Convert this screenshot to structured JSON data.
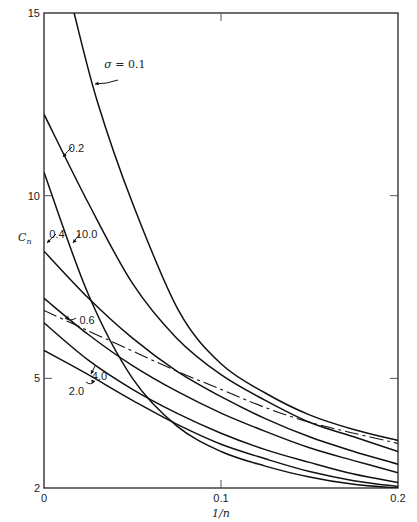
{
  "chart_data": {
    "type": "line",
    "title": "",
    "xlabel": "1/n",
    "ylabel": "C_n",
    "xlim": [
      0,
      0.2
    ],
    "ylim": [
      2,
      15
    ],
    "grid": false,
    "x_ticks": [
      {
        "value": 0,
        "label": "0"
      },
      {
        "value": 0.1,
        "label": "0.1"
      },
      {
        "value": 0.2,
        "label": "0.2"
      }
    ],
    "y_ticks": [
      {
        "value": 2,
        "label": "2"
      },
      {
        "value": 5,
        "label": "5"
      },
      {
        "value": 10,
        "label": "10"
      },
      {
        "value": 15,
        "label": "15"
      }
    ],
    "x": [
      0,
      0.025,
      0.05,
      0.075,
      0.1,
      0.125,
      0.15,
      0.175,
      0.2
    ],
    "series": [
      {
        "name": "σ = 0.1",
        "label": "σ = 0.1",
        "style": "solid",
        "points": [
          [
            0.017,
            15.0
          ],
          [
            0.03,
            12.6
          ],
          [
            0.05,
            9.8
          ],
          [
            0.076,
            6.86
          ],
          [
            0.1,
            5.4
          ],
          [
            0.125,
            4.6
          ],
          [
            0.15,
            4.0
          ],
          [
            0.175,
            3.6
          ],
          [
            0.2,
            3.3
          ]
        ]
      },
      {
        "name": "σ = 0.2",
        "label": "0.2",
        "style": "solid",
        "values": [
          12.23,
          9.8,
          7.6,
          6.1,
          5.1,
          4.4,
          3.8,
          3.4,
          3.0
        ]
      },
      {
        "name": "σ = 10.0",
        "label": "10.0",
        "style": "solid",
        "values": [
          10.64,
          7.3,
          5.0,
          3.7,
          3.0,
          2.6,
          2.3,
          2.1,
          2.0
        ]
      },
      {
        "name": "σ = 0.4",
        "label": "0.4",
        "style": "solid",
        "values": [
          8.48,
          7.2,
          6.1,
          5.2,
          4.5,
          3.9,
          3.4,
          3.0,
          2.65
        ]
      },
      {
        "name": "σ = 0.6",
        "label": "0.6",
        "style": "solid",
        "values": [
          7.19,
          6.2,
          5.35,
          4.65,
          4.05,
          3.55,
          3.1,
          2.75,
          2.42
        ]
      },
      {
        "name": "reference (dashed)",
        "label": "",
        "style": "dashed",
        "values": [
          6.86,
          6.3,
          5.75,
          5.2,
          4.7,
          4.2,
          3.8,
          3.5,
          3.22
        ]
      },
      {
        "name": "σ = 4.0",
        "label": "4.0",
        "style": "solid",
        "values": [
          6.52,
          5.5,
          4.7,
          4.05,
          3.5,
          3.05,
          2.7,
          2.38,
          2.15
        ]
      },
      {
        "name": "σ = 2.0",
        "label": "2.0",
        "style": "solid",
        "values": [
          5.77,
          5.1,
          4.4,
          3.75,
          3.2,
          2.8,
          2.45,
          2.2,
          2.04
        ]
      }
    ],
    "annotations": [
      {
        "text": "σ = 0.1",
        "x": 0.034,
        "y": 13.5
      },
      {
        "text": "0.2",
        "x": 0.014,
        "y": 11.2
      },
      {
        "text": "0.4",
        "x": 0.003,
        "y": 8.85
      },
      {
        "text": "10.0",
        "x": 0.018,
        "y": 8.85
      },
      {
        "text": "0.6",
        "x": 0.02,
        "y": 6.5
      },
      {
        "text": "4.0",
        "x": 0.027,
        "y": 4.95
      },
      {
        "text": "2.0",
        "x": 0.014,
        "y": 4.55
      }
    ],
    "legend": "none (inline curve labels)"
  }
}
